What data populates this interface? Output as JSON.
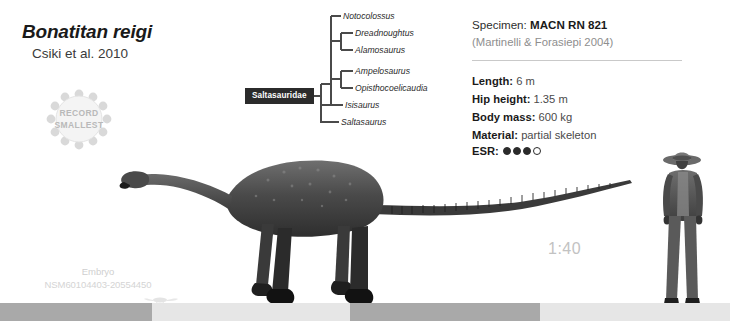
{
  "title": {
    "taxon_name": "Bonatitan reigi",
    "authority": "Csiki et al. 2010"
  },
  "record_badge": {
    "line1": "RECORD",
    "line2": "SMALLEST"
  },
  "cladogram": {
    "clade_label": "Saltasauridae",
    "taxa": [
      {
        "name": "Notocolossus",
        "x": 92,
        "y": 4
      },
      {
        "name": "Dreadnoughtus",
        "x": 105,
        "y": 21
      },
      {
        "name": "Alamosaurus",
        "x": 105,
        "y": 38
      },
      {
        "name": "Ampelosaurus",
        "x": 105,
        "y": 59
      },
      {
        "name": "Opisthocoelicaudia",
        "x": 105,
        "y": 76
      },
      {
        "name": "Isisaurus",
        "x": 78,
        "y": 93
      },
      {
        "name": "Saltasaurus",
        "x": 70,
        "y": 110
      }
    ]
  },
  "specimen": {
    "label": "Specimen:",
    "id": "MACN RN 821",
    "reference": "(Martinelli & Forasiepi 2004)",
    "rows": [
      {
        "label": "Length:",
        "value": "6 m"
      },
      {
        "label": "Hip height:",
        "value": "1.35 m"
      },
      {
        "label": "Body mass:",
        "value": "600 kg"
      },
      {
        "label": "Material:",
        "value": "partial skeleton"
      }
    ],
    "esr_label": "ESR:",
    "esr_filled": 3,
    "esr_total": 4
  },
  "scale": {
    "ratio": "1:40"
  },
  "embryo": {
    "line1": "Embryo",
    "line2": "NSM60104403-20554450"
  },
  "colors": {
    "ink": "#1a1a1a",
    "muted": "#8e8e8e",
    "faint": "#cfcfcf",
    "clade_box_bg": "#2b2b2b",
    "ground_dark": "#a9a9a9",
    "ground_light": "#e6e6e6",
    "silhouette": "#555555"
  },
  "ground_segments": [
    {
      "x": 0,
      "width": 152,
      "tone": "dark"
    },
    {
      "x": 152,
      "width": 198,
      "tone": "light"
    },
    {
      "x": 350,
      "width": 190,
      "tone": "dark"
    },
    {
      "x": 540,
      "width": 190,
      "tone": "light"
    }
  ]
}
